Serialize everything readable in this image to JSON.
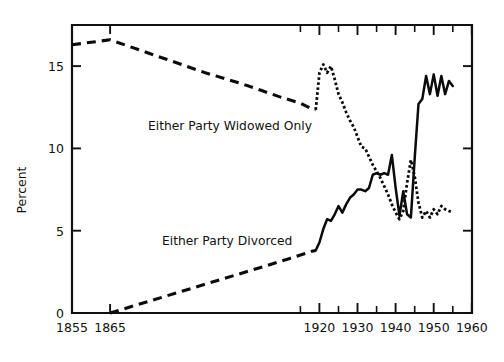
{
  "chart_data": {
    "type": "line",
    "title": "",
    "xlabel": "",
    "ylabel": "Percent",
    "xlim": [
      1855,
      1960
    ],
    "ylim": [
      0,
      17.5
    ],
    "grid": false,
    "legend_position": "inline-annotations",
    "x_ticks_major": [
      1855,
      1865,
      1920,
      1930,
      1940,
      1950,
      1960
    ],
    "x_tick_labels": [
      "1855",
      "1865",
      "1920",
      "1930",
      "1940",
      "1950",
      "1960"
    ],
    "x_ticks_minor": [
      1925,
      1935,
      1945,
      1955
    ],
    "y_ticks": [
      0,
      5,
      10,
      15
    ],
    "y_tick_labels": [
      "0",
      "5",
      "10",
      "15"
    ],
    "series": [
      {
        "name": "Either Party Widowed Only",
        "style": "dashed-then-dotted",
        "annotation": "Either Party Widowed Only",
        "annotation_x": 1893,
        "annotation_y": 11.6,
        "segments": [
          {
            "style": "dashed-long",
            "points": [
              [
                1855,
                16.3
              ],
              [
                1860,
                16.45
              ],
              [
                1865,
                16.6
              ],
              [
                1870,
                16.2
              ],
              [
                1875,
                15.8
              ],
              [
                1880,
                15.4
              ],
              [
                1885,
                15.0
              ],
              [
                1890,
                14.6
              ],
              [
                1895,
                14.25
              ],
              [
                1900,
                13.9
              ],
              [
                1905,
                13.5
              ],
              [
                1910,
                13.1
              ],
              [
                1915,
                12.75
              ],
              [
                1918,
                12.4
              ],
              [
                1919,
                12.35
              ]
            ]
          },
          {
            "style": "dotted-fine",
            "points": [
              [
                1919,
                12.35
              ],
              [
                1920,
                14.6
              ],
              [
                1921,
                15.1
              ],
              [
                1922,
                14.6
              ],
              [
                1923,
                15.0
              ],
              [
                1924,
                14.2
              ],
              [
                1925,
                13.3
              ],
              [
                1926,
                12.8
              ],
              [
                1927,
                12.2
              ],
              [
                1928,
                11.7
              ],
              [
                1929,
                11.3
              ],
              [
                1930,
                10.7
              ],
              [
                1931,
                10.1
              ],
              [
                1932,
                10.0
              ],
              [
                1933,
                9.5
              ],
              [
                1934,
                9.0
              ],
              [
                1935,
                8.6
              ],
              [
                1936,
                8.2
              ],
              [
                1937,
                7.7
              ],
              [
                1938,
                7.2
              ],
              [
                1939,
                6.6
              ],
              [
                1940,
                6.1
              ],
              [
                1941,
                5.7
              ],
              [
                1942,
                6.2
              ],
              [
                1943,
                7.9
              ],
              [
                1944,
                9.3
              ],
              [
                1945,
                8.3
              ],
              [
                1946,
                6.7
              ],
              [
                1947,
                5.8
              ],
              [
                1948,
                6.2
              ],
              [
                1949,
                5.8
              ],
              [
                1950,
                6.3
              ],
              [
                1951,
                6.0
              ],
              [
                1952,
                6.5
              ],
              [
                1953,
                6.3
              ],
              [
                1954,
                6.2
              ],
              [
                1955,
                6.1
              ]
            ]
          }
        ]
      },
      {
        "name": "Either Party Divorced",
        "style": "dashed-then-solid",
        "annotation": "Either Party Divorced",
        "annotation_x": 1893,
        "annotation_y": 4.3,
        "segments": [
          {
            "style": "dashed-long",
            "points": [
              [
                1865,
                0.0
              ],
              [
                1875,
                0.7
              ],
              [
                1885,
                1.4
              ],
              [
                1895,
                2.1
              ],
              [
                1905,
                2.8
              ],
              [
                1912,
                3.3
              ],
              [
                1918,
                3.75
              ],
              [
                1919,
                3.8
              ]
            ]
          },
          {
            "style": "solid",
            "points": [
              [
                1919,
                3.8
              ],
              [
                1920,
                4.3
              ],
              [
                1921,
                5.1
              ],
              [
                1922,
                5.7
              ],
              [
                1923,
                5.6
              ],
              [
                1924,
                6.0
              ],
              [
                1925,
                6.5
              ],
              [
                1926,
                6.1
              ],
              [
                1927,
                6.6
              ],
              [
                1928,
                7.0
              ],
              [
                1929,
                7.2
              ],
              [
                1930,
                7.5
              ],
              [
                1931,
                7.5
              ],
              [
                1932,
                7.4
              ],
              [
                1933,
                7.6
              ],
              [
                1934,
                8.4
              ],
              [
                1935,
                8.5
              ],
              [
                1936,
                8.4
              ],
              [
                1937,
                8.5
              ],
              [
                1938,
                8.4
              ],
              [
                1939,
                9.6
              ],
              [
                1940,
                7.6
              ],
              [
                1941,
                5.9
              ],
              [
                1942,
                7.4
              ],
              [
                1943,
                6.0
              ],
              [
                1944,
                5.8
              ],
              [
                1945,
                9.4
              ],
              [
                1946,
                12.7
              ],
              [
                1947,
                13.0
              ],
              [
                1948,
                14.4
              ],
              [
                1949,
                13.3
              ],
              [
                1950,
                14.5
              ],
              [
                1951,
                13.2
              ],
              [
                1952,
                14.4
              ],
              [
                1953,
                13.3
              ],
              [
                1954,
                14.1
              ],
              [
                1955,
                13.8
              ]
            ]
          }
        ]
      }
    ]
  },
  "axes": {
    "y_axis_title": "Percent"
  }
}
